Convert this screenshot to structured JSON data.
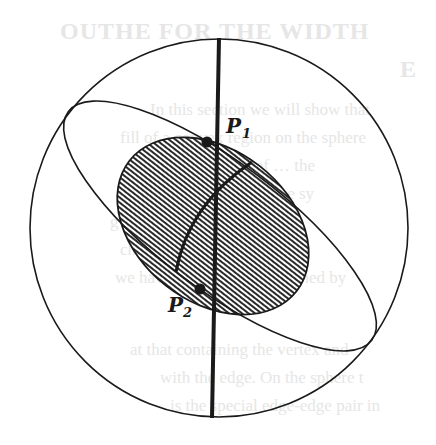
{
  "figure": {
    "type": "geometric diagram",
    "labels": {
      "p1": {
        "main": "P",
        "sub": "1"
      },
      "p2": {
        "main": "P",
        "sub": "2"
      }
    },
    "colors": {
      "ink": "#1a1a1a",
      "background": "#ffffff",
      "hatch": "#2a2a2a",
      "bleed_through_text": "#e6e6e6"
    },
    "geometry": {
      "outer_circle": {
        "cx": 219,
        "cy": 228,
        "r": 189
      },
      "great_circle_ellipse": {
        "cx": 220,
        "cy": 226,
        "rx": 190,
        "ry": 63,
        "rotate_deg": 37
      },
      "hatched_region": {
        "cx": 213,
        "cy": 226,
        "rx": 106,
        "ry": 76,
        "rotate_deg": 38,
        "hatch": "horizontal",
        "hatch_pitch_px": 4
      },
      "axis_line": {
        "x1": 219,
        "y1": 38,
        "x2": 212,
        "y2": 418
      },
      "arc": {
        "from": [
          176,
          272
        ],
        "ctrl": [
          195,
          200
        ],
        "to": [
          252,
          162
        ]
      },
      "point_p1": {
        "x": 207,
        "y": 142
      },
      "point_p2": {
        "x": 200,
        "y": 289
      }
    }
  },
  "bleed_through": {
    "heading_line1": "OUTHE FOR THE WIDTH",
    "heading_line2": "E",
    "lines": [
      "In this section we will show that",
      "fill of a convex region on the sphere",
      "ction of the width of … the",
      "ll often uniquely … plane sy",
      "g one unique … the re- p",
      "ch of uniquely -edge unit",
      "we have dealt the cone defined by",
      "at that containing the vertex and",
      "with the edge. On the sphere t",
      "is the special edge-edge pair in"
    ]
  }
}
